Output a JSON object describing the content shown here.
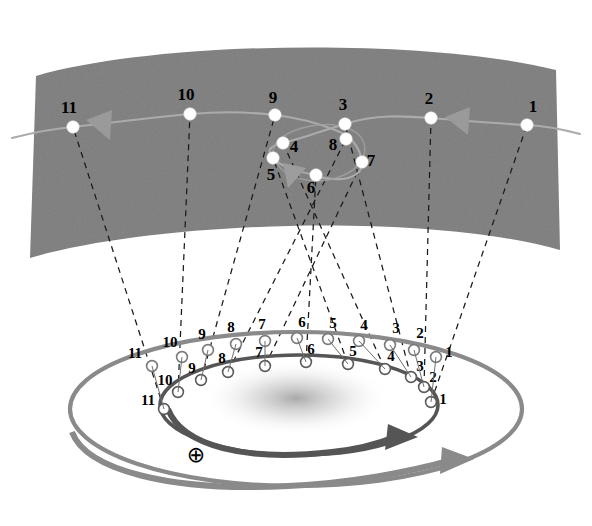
{
  "figure": {
    "background_color": "#ffffff",
    "sky_band_color": "#7d7d7d",
    "sky_dot_color": "#ffffff",
    "sky_path_color": "#a8a8a8",
    "sight_line_color": "#1a1a1a",
    "outer_orbit_color": "#8a8a8a",
    "inner_orbit_color": "#555555",
    "ring_node_fill": "#ffffff",
    "ring_node_stroke": "#6b6b6b",
    "arrow_color_outer": "#8a8a8a",
    "arrow_color_inner": "#555555",
    "sun_glow_color": "#cfcfcf"
  },
  "sky": {
    "band_name": "celestial-sphere-band",
    "apparent_path_name": "apparent-path-of-planet",
    "direction_arrow_labels": [
      "westward-arrow-left",
      "westward-arrow-middle",
      "westward-arrow-right"
    ],
    "positions": [
      {
        "label": "1",
        "x": 527,
        "y": 125,
        "tx": 533,
        "ty": 112
      },
      {
        "label": "2",
        "x": 431,
        "y": 118,
        "tx": 429,
        "ty": 104
      },
      {
        "label": "3",
        "x": 345,
        "y": 124,
        "tx": 343,
        "ty": 110
      },
      {
        "label": "4",
        "x": 283,
        "y": 143,
        "tx": 294,
        "ty": 152
      },
      {
        "label": "5",
        "x": 273,
        "y": 158,
        "tx": 271,
        "ty": 180
      },
      {
        "label": "6",
        "x": 316,
        "y": 175,
        "tx": 311,
        "ty": 193
      },
      {
        "label": "7",
        "x": 362,
        "y": 162,
        "tx": 371,
        "ty": 166
      },
      {
        "label": "8",
        "x": 346,
        "y": 139,
        "tx": 333,
        "ty": 150
      },
      {
        "label": "9",
        "x": 275,
        "y": 115,
        "tx": 273,
        "ty": 103
      },
      {
        "label": "10",
        "x": 190,
        "y": 114,
        "tx": 186,
        "ty": 100
      },
      {
        "label": "11",
        "x": 73,
        "y": 127,
        "tx": 69,
        "ty": 113
      }
    ]
  },
  "orbits": {
    "outer_orbit_name": "planet-orbit-outer",
    "inner_orbit_name": "earth-orbit-inner",
    "outer_nodes": [
      {
        "label": "1",
        "x": 436,
        "y": 357,
        "tx": 449,
        "ty": 357
      },
      {
        "label": "2",
        "x": 414,
        "y": 350,
        "tx": 420,
        "ty": 338
      },
      {
        "label": "3",
        "x": 390,
        "y": 345,
        "tx": 396,
        "ty": 333
      },
      {
        "label": "4",
        "x": 359,
        "y": 341,
        "tx": 364,
        "ty": 330
      },
      {
        "label": "5",
        "x": 328,
        "y": 339,
        "tx": 333,
        "ty": 328
      },
      {
        "label": "6",
        "x": 297,
        "y": 338,
        "tx": 302,
        "ty": 327
      },
      {
        "label": "7",
        "x": 265,
        "y": 341,
        "tx": 262,
        "ty": 329
      },
      {
        "label": "8",
        "x": 236,
        "y": 344,
        "tx": 231,
        "ty": 332
      },
      {
        "label": "9",
        "x": 208,
        "y": 350,
        "tx": 202,
        "ty": 339
      },
      {
        "label": "10",
        "x": 182,
        "y": 357,
        "tx": 170,
        "ty": 347
      },
      {
        "label": "11",
        "x": 152,
        "y": 366,
        "tx": 135,
        "ty": 358
      }
    ],
    "inner_nodes": [
      {
        "label": "1",
        "x": 431,
        "y": 402,
        "tx": 443,
        "ty": 404
      },
      {
        "label": "2",
        "x": 424,
        "y": 387,
        "tx": 433,
        "ty": 382
      },
      {
        "label": "3",
        "x": 411,
        "y": 377,
        "tx": 420,
        "ty": 371
      },
      {
        "label": "4",
        "x": 385,
        "y": 369,
        "tx": 391,
        "ty": 361
      },
      {
        "label": "5",
        "x": 348,
        "y": 364,
        "tx": 353,
        "ty": 356
      },
      {
        "label": "6",
        "x": 306,
        "y": 362,
        "tx": 311,
        "ty": 354
      },
      {
        "label": "7",
        "x": 265,
        "y": 366,
        "tx": 259,
        "ty": 357
      },
      {
        "label": "8",
        "x": 228,
        "y": 372,
        "tx": 222,
        "ty": 363
      },
      {
        "label": "9",
        "x": 201,
        "y": 380,
        "tx": 192,
        "ty": 373
      },
      {
        "label": "10",
        "x": 178,
        "y": 392,
        "tx": 165,
        "ty": 385
      },
      {
        "label": "11",
        "x": 164,
        "y": 409,
        "tx": 148,
        "ty": 405
      }
    ]
  },
  "earth": {
    "symbol": "⊕",
    "symbol_name": "earth-symbol",
    "x": 196,
    "y": 462
  },
  "motion_arrows": {
    "inner_label": "earth-orbital-direction-arrow",
    "outer_label": "planet-orbital-direction-arrow"
  },
  "sun": {
    "name": "sun-glow",
    "x": 296,
    "y": 398
  }
}
